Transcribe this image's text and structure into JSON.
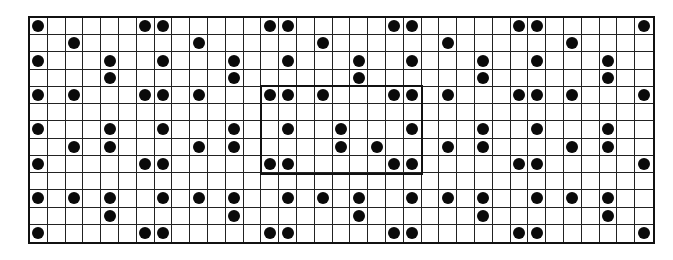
{
  "grid": {
    "rows": 13,
    "cols": 35,
    "dot_color": "#0a0a0a",
    "line_color": "#222222",
    "dots_by_row": [
      [
        0,
        6,
        7,
        13,
        14,
        20,
        21,
        27,
        28,
        34
      ],
      [
        2,
        9,
        16,
        23,
        30
      ],
      [
        0,
        4,
        7,
        11,
        14,
        18,
        21,
        25,
        28,
        32
      ],
      [
        4,
        11,
        18,
        25,
        32
      ],
      [
        0,
        2,
        6,
        7,
        9,
        13,
        14,
        16,
        20,
        21,
        23,
        27,
        28,
        30,
        34
      ],
      [],
      [
        0,
        4,
        7,
        11,
        14,
        17,
        21,
        25,
        28,
        32
      ],
      [
        2,
        4,
        9,
        11,
        17,
        19,
        23,
        25,
        30,
        32
      ],
      [
        0,
        6,
        7,
        13,
        14,
        20,
        21,
        27,
        28,
        34
      ],
      [],
      [
        0,
        2,
        4,
        7,
        9,
        11,
        14,
        16,
        18,
        21,
        23,
        25,
        28,
        30,
        32
      ],
      [
        4,
        11,
        18,
        25,
        32
      ],
      [
        0,
        6,
        7,
        13,
        14,
        20,
        21,
        27,
        28,
        34
      ]
    ],
    "highlight": {
      "col_start": 13,
      "col_end": 21,
      "row_start": 4,
      "row_end": 8
    }
  }
}
